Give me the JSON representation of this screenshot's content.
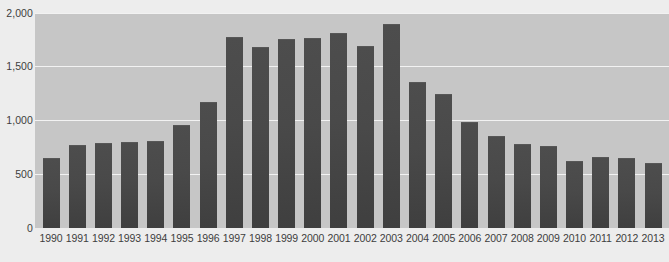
{
  "chart_data": {
    "type": "bar",
    "title": "",
    "xlabel": "",
    "ylabel": "",
    "categories": [
      "1990",
      "1991",
      "1992",
      "1993",
      "1994",
      "1995",
      "1996",
      "1997",
      "1998",
      "1999",
      "2000",
      "2001",
      "2002",
      "2003",
      "2004",
      "2005",
      "2006",
      "2007",
      "2008",
      "2009",
      "2010",
      "2011",
      "2012",
      "2013"
    ],
    "values": [
      650,
      770,
      790,
      800,
      810,
      955,
      1175,
      1775,
      1680,
      1760,
      1770,
      1810,
      1690,
      1900,
      1360,
      1245,
      985,
      855,
      780,
      760,
      620,
      665,
      650,
      605
    ],
    "ylim": [
      0,
      2000
    ],
    "y_ticks": [
      0,
      500,
      1000,
      1500,
      2000
    ],
    "y_tick_labels": [
      "0",
      "500",
      "1,000",
      "1,500",
      "2,000"
    ],
    "grid": true,
    "legend": "none",
    "colors": {
      "bar": "#4a4a4a",
      "plot_background": "#c6c6c6",
      "page_background": "#ededed",
      "gridline": "#f2f2f2",
      "tick_text": "#3d3d3d"
    }
  }
}
